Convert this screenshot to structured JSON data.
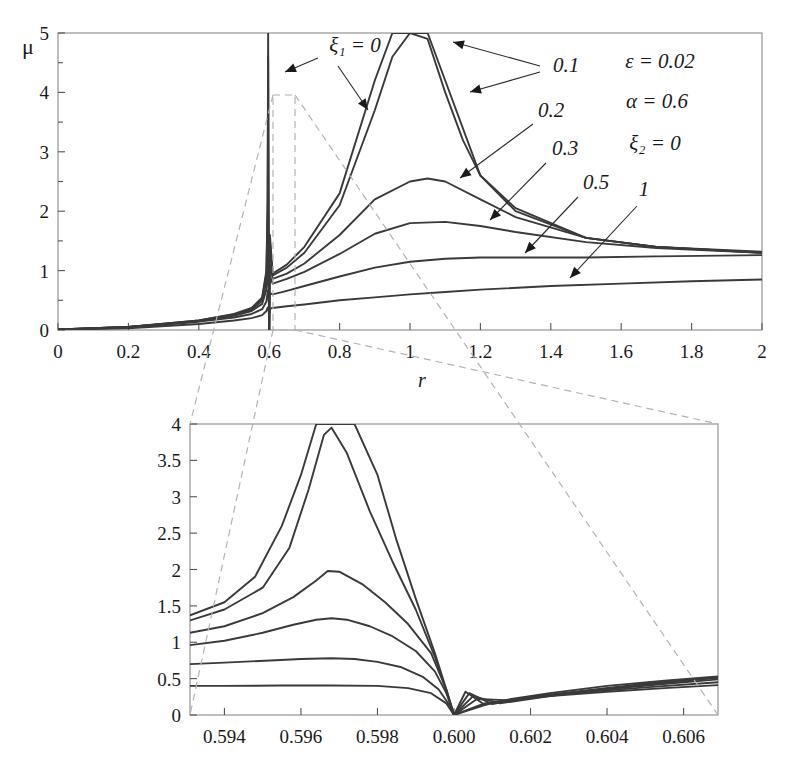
{
  "figure": {
    "title": "",
    "background": "#ffffff",
    "curve_color": "#3a3a3a",
    "dashed_connector_color": "#b3b3b3"
  },
  "parameters": {
    "epsilon": "ε = 0.02",
    "alpha": "α = 0.6",
    "xi2": "ξ₂ = 0"
  },
  "main_plot": {
    "ylabel": "μ",
    "xlabel": "r",
    "x_ticks": [
      "0",
      "0.2",
      "0.4",
      "0.6",
      "0.8",
      "1",
      "1.2",
      "1.4",
      "1.6",
      "1.8",
      "2"
    ],
    "y_ticks": [
      "0",
      "1",
      "2",
      "3",
      "4",
      "5"
    ],
    "first_curve_label": "ξ₁ = 0",
    "curve_labels": [
      "0.1",
      "0.2",
      "0.3",
      "0.5",
      "1"
    ]
  },
  "inset_plot": {
    "x_ticks": [
      "0.594",
      "0.596",
      "0.598",
      "0.600",
      "0.602",
      "0.604",
      "0.606"
    ],
    "y_ticks": [
      "0",
      "0.5",
      "1",
      "1.5",
      "2",
      "2.5",
      "3",
      "3.5",
      "4"
    ]
  },
  "chart_data": [
    {
      "type": "line",
      "id": "main",
      "title": "",
      "xlabel": "r",
      "ylabel": "μ",
      "xlim": [
        0,
        2
      ],
      "ylim": [
        0,
        5
      ],
      "xticks": [
        0,
        0.2,
        0.4,
        0.6,
        0.8,
        1.0,
        1.2,
        1.4,
        1.6,
        1.8,
        2.0
      ],
      "yticks": [
        0,
        1,
        2,
        3,
        4,
        5
      ],
      "minor_y_ticks": [
        0.5,
        1.5,
        2.5,
        3.5,
        4.5
      ],
      "grid": false,
      "legend": "inline-labels-with-leader-arrows",
      "annotations": [
        "ε = 0.02",
        "α = 0.6",
        "ξ₂ = 0"
      ],
      "notes": "Frequency response of damped vibration absorber. All curves share an anti-resonance notch to μ=0 at r=0.600 and a narrow spike at r≈0.597. Curves converge near μ≈1.3 at r=2 (except ξ₁=1 which reaches ≈0.85).",
      "series": [
        {
          "name": "ξ₁ = 0",
          "label": "0",
          "x": [
            0,
            0.2,
            0.4,
            0.5,
            0.55,
            0.58,
            0.592,
            0.5955,
            0.597,
            0.5985,
            0.5995,
            0.6,
            0.6005,
            0.602,
            0.61,
            0.65,
            0.7,
            0.8,
            0.9,
            0.95,
            0.98,
            1.0,
            1.02,
            1.05,
            1.1,
            1.2,
            1.3,
            1.5,
            1.7,
            2.0
          ],
          "y": [
            0.01,
            0.05,
            0.16,
            0.27,
            0.37,
            0.55,
            1.0,
            2.2,
            5.0,
            2.0,
            0.7,
            0.0,
            0.8,
            1.6,
            0.95,
            1.1,
            1.4,
            2.3,
            4.2,
            5.0,
            5.0,
            5.0,
            5.0,
            5.0,
            4.2,
            2.6,
            2.0,
            1.55,
            1.4,
            1.32
          ]
        },
        {
          "name": "ξ₁ = 0.1",
          "label": "0.1",
          "x": [
            0,
            0.2,
            0.4,
            0.5,
            0.55,
            0.58,
            0.592,
            0.5955,
            0.597,
            0.5985,
            0.5995,
            0.6,
            0.6005,
            0.602,
            0.61,
            0.65,
            0.7,
            0.8,
            0.9,
            0.95,
            1.0,
            1.05,
            1.1,
            1.15,
            1.2,
            1.3,
            1.5,
            1.7,
            2.0
          ],
          "y": [
            0.01,
            0.05,
            0.16,
            0.26,
            0.36,
            0.53,
            0.95,
            2.0,
            4.6,
            1.9,
            0.65,
            0.0,
            0.75,
            1.5,
            0.92,
            1.05,
            1.3,
            2.1,
            3.7,
            4.6,
            5.0,
            4.9,
            4.0,
            3.2,
            2.6,
            2.05,
            1.55,
            1.4,
            1.3
          ]
        },
        {
          "name": "ξ₁ = 0.2",
          "label": "0.2",
          "x": [
            0,
            0.2,
            0.4,
            0.5,
            0.55,
            0.58,
            0.592,
            0.596,
            0.598,
            0.5995,
            0.6,
            0.6005,
            0.602,
            0.61,
            0.65,
            0.7,
            0.8,
            0.9,
            1.0,
            1.05,
            1.1,
            1.2,
            1.3,
            1.5,
            1.7,
            2.0
          ],
          "y": [
            0.01,
            0.05,
            0.15,
            0.25,
            0.34,
            0.49,
            0.82,
            1.5,
            1.1,
            0.5,
            0.0,
            0.6,
            1.1,
            0.86,
            0.95,
            1.12,
            1.6,
            2.2,
            2.5,
            2.55,
            2.5,
            2.2,
            1.9,
            1.55,
            1.4,
            1.3
          ]
        },
        {
          "name": "ξ₁ = 0.3",
          "label": "0.3",
          "x": [
            0,
            0.2,
            0.4,
            0.5,
            0.55,
            0.58,
            0.592,
            0.596,
            0.598,
            0.5995,
            0.6,
            0.6005,
            0.602,
            0.61,
            0.65,
            0.7,
            0.8,
            0.9,
            1.0,
            1.1,
            1.2,
            1.3,
            1.5,
            1.7,
            2.0
          ],
          "y": [
            0.01,
            0.05,
            0.15,
            0.24,
            0.32,
            0.44,
            0.68,
            1.05,
            0.85,
            0.45,
            0.0,
            0.5,
            0.9,
            0.78,
            0.86,
            0.98,
            1.28,
            1.62,
            1.8,
            1.82,
            1.75,
            1.65,
            1.48,
            1.38,
            1.3
          ]
        },
        {
          "name": "ξ₁ = 0.5",
          "label": "0.5",
          "x": [
            0,
            0.2,
            0.4,
            0.5,
            0.55,
            0.58,
            0.592,
            0.596,
            0.598,
            0.5995,
            0.6,
            0.6005,
            0.602,
            0.61,
            0.65,
            0.7,
            0.8,
            0.9,
            1.0,
            1.1,
            1.2,
            1.3,
            1.5,
            1.7,
            2.0
          ],
          "y": [
            0.01,
            0.04,
            0.14,
            0.21,
            0.27,
            0.35,
            0.48,
            0.66,
            0.58,
            0.35,
            0.0,
            0.4,
            0.62,
            0.6,
            0.66,
            0.74,
            0.9,
            1.05,
            1.15,
            1.2,
            1.22,
            1.22,
            1.22,
            1.24,
            1.26
          ]
        },
        {
          "name": "ξ₁ = 1",
          "label": "1",
          "x": [
            0,
            0.2,
            0.4,
            0.5,
            0.55,
            0.58,
            0.592,
            0.596,
            0.598,
            0.5995,
            0.6,
            0.6005,
            0.602,
            0.61,
            0.65,
            0.7,
            0.8,
            0.9,
            1.0,
            1.1,
            1.2,
            1.4,
            1.6,
            1.8,
            2.0
          ],
          "y": [
            0.005,
            0.03,
            0.1,
            0.16,
            0.2,
            0.25,
            0.32,
            0.38,
            0.35,
            0.25,
            0.0,
            0.28,
            0.36,
            0.37,
            0.4,
            0.43,
            0.5,
            0.55,
            0.6,
            0.64,
            0.68,
            0.74,
            0.78,
            0.82,
            0.85
          ]
        }
      ]
    },
    {
      "type": "line",
      "id": "inset",
      "title": "",
      "xlabel": "",
      "ylabel": "",
      "xlim": [
        0.5931,
        0.6069
      ],
      "ylim": [
        0,
        4
      ],
      "xticks": [
        0.594,
        0.596,
        0.598,
        0.6,
        0.602,
        0.604,
        0.606
      ],
      "yticks": [
        0,
        0.5,
        1.0,
        1.5,
        2.0,
        2.5,
        3.0,
        3.5,
        4.0
      ],
      "grid": false,
      "notes": "Magnified view of the anti-resonance region of the main plot. Peaks occur near r=0.5967; all curves drop to 0 at r=0.600 then rise again toward 0.5 at r=0.607.",
      "series": [
        {
          "name": "ξ₁ = 0",
          "label": "0",
          "x": [
            0.5931,
            0.594,
            0.5948,
            0.5955,
            0.596,
            0.5964,
            0.5967,
            0.597,
            0.5974,
            0.598,
            0.5985,
            0.599,
            0.5995,
            0.5998,
            0.6,
            0.6003,
            0.6008,
            0.6015,
            0.6025,
            0.604,
            0.6055,
            0.6069
          ],
          "y": [
            1.37,
            1.55,
            1.9,
            2.6,
            3.3,
            4.0,
            4.0,
            4.0,
            4.0,
            3.3,
            2.4,
            1.6,
            0.85,
            0.35,
            0.0,
            0.32,
            0.14,
            0.22,
            0.3,
            0.4,
            0.47,
            0.53
          ]
        },
        {
          "name": "ξ₁ = 0.1",
          "label": "0.1",
          "x": [
            0.5931,
            0.594,
            0.595,
            0.5957,
            0.5962,
            0.5966,
            0.5968,
            0.5972,
            0.5978,
            0.5984,
            0.599,
            0.5995,
            0.5998,
            0.6,
            0.6004,
            0.601,
            0.602,
            0.6035,
            0.605,
            0.6069
          ],
          "y": [
            1.3,
            1.45,
            1.75,
            2.3,
            3.1,
            3.85,
            3.95,
            3.6,
            2.8,
            2.1,
            1.45,
            0.8,
            0.33,
            0.0,
            0.3,
            0.15,
            0.25,
            0.34,
            0.43,
            0.52
          ]
        },
        {
          "name": "ξ₁ = 0.2",
          "label": "0.2",
          "x": [
            0.5931,
            0.594,
            0.595,
            0.5958,
            0.5964,
            0.5967,
            0.597,
            0.5976,
            0.5982,
            0.5988,
            0.5994,
            0.5998,
            0.6,
            0.6005,
            0.6012,
            0.6025,
            0.604,
            0.6055,
            0.6069
          ],
          "y": [
            1.13,
            1.22,
            1.4,
            1.62,
            1.85,
            1.98,
            1.97,
            1.8,
            1.55,
            1.25,
            0.85,
            0.35,
            0.0,
            0.26,
            0.16,
            0.26,
            0.36,
            0.44,
            0.51
          ]
        },
        {
          "name": "ξ₁ = 0.3",
          "label": "0.3",
          "x": [
            0.5931,
            0.594,
            0.595,
            0.5958,
            0.5964,
            0.5968,
            0.5972,
            0.5978,
            0.5984,
            0.599,
            0.5995,
            0.5998,
            0.6,
            0.6006,
            0.6015,
            0.603,
            0.6045,
            0.6069
          ],
          "y": [
            0.96,
            1.02,
            1.13,
            1.24,
            1.31,
            1.33,
            1.31,
            1.22,
            1.08,
            0.88,
            0.6,
            0.3,
            0.0,
            0.22,
            0.2,
            0.3,
            0.38,
            0.49
          ]
        },
        {
          "name": "ξ₁ = 0.5",
          "label": "0.5",
          "x": [
            0.5931,
            0.594,
            0.5952,
            0.596,
            0.5968,
            0.5974,
            0.598,
            0.5986,
            0.5992,
            0.5996,
            0.5999,
            0.6,
            0.6008,
            0.602,
            0.6035,
            0.605,
            0.6069
          ],
          "y": [
            0.7,
            0.72,
            0.75,
            0.77,
            0.78,
            0.77,
            0.73,
            0.66,
            0.52,
            0.35,
            0.12,
            0.0,
            0.16,
            0.24,
            0.32,
            0.38,
            0.45
          ]
        },
        {
          "name": "ξ₁ = 1",
          "label": "1",
          "x": [
            0.5931,
            0.594,
            0.5955,
            0.5968,
            0.598,
            0.5988,
            0.5994,
            0.5998,
            0.6,
            0.601,
            0.6025,
            0.604,
            0.6055,
            0.6069
          ],
          "y": [
            0.4,
            0.4,
            0.405,
            0.405,
            0.4,
            0.37,
            0.3,
            0.16,
            0.0,
            0.17,
            0.26,
            0.32,
            0.37,
            0.41
          ]
        }
      ]
    }
  ]
}
